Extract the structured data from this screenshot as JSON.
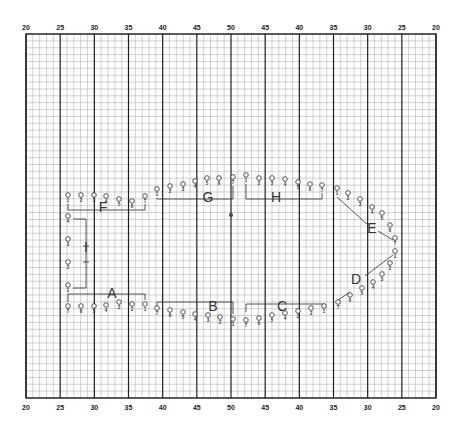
{
  "diagram": {
    "type": "seating-plan-on-graph-paper",
    "colors": {
      "ink": "#2a2a2a",
      "grid_minor": "#9a9a9a",
      "grid_major": "#1e1e1e",
      "paper": "#ffffff"
    },
    "grid": {
      "left": 26,
      "right": 436,
      "top": 34,
      "bottom": 398,
      "minor_step": 6.83,
      "major_every": 5
    },
    "axis_top_labels": [
      "20",
      "25",
      "30",
      "35",
      "40",
      "45",
      "50",
      "45",
      "40",
      "35",
      "30",
      "25",
      "20"
    ],
    "axis_bottom_labels": [
      "20",
      "25",
      "30",
      "35",
      "40",
      "45",
      "50",
      "45",
      "40",
      "35",
      "30",
      "25",
      "20"
    ],
    "center_mark": {
      "x": 231,
      "y": 215
    },
    "groups": [
      {
        "label": "A",
        "x": 112,
        "y": 298
      },
      {
        "label": "B",
        "x": 213,
        "y": 311
      },
      {
        "label": "C",
        "x": 282,
        "y": 311
      },
      {
        "label": "D",
        "x": 356,
        "y": 284
      },
      {
        "label": "E",
        "x": 372,
        "y": 233
      },
      {
        "label": "F",
        "x": 103,
        "y": 212
      },
      {
        "label": "G",
        "x": 208,
        "y": 202
      },
      {
        "label": "H",
        "x": 276,
        "y": 202
      },
      {
        "label": "I",
        "x": 86,
        "y": 252
      }
    ],
    "seats": [
      {
        "n": "1",
        "x": 68,
        "y": 198
      },
      {
        "n": "2",
        "x": 81,
        "y": 198
      },
      {
        "n": "3",
        "x": 94,
        "y": 198
      },
      {
        "n": "4",
        "x": 106,
        "y": 199
      },
      {
        "n": "5",
        "x": 119,
        "y": 202
      },
      {
        "n": "6",
        "x": 132,
        "y": 204
      },
      {
        "n": "7",
        "x": 145,
        "y": 199
      },
      {
        "n": "1",
        "x": 157,
        "y": 192
      },
      {
        "n": "2",
        "x": 170,
        "y": 189
      },
      {
        "n": "3",
        "x": 183,
        "y": 187
      },
      {
        "n": "4",
        "x": 195,
        "y": 184
      },
      {
        "n": "5",
        "x": 207,
        "y": 181
      },
      {
        "n": "6",
        "x": 219,
        "y": 181
      },
      {
        "n": "7",
        "x": 233,
        "y": 180
      },
      {
        "n": "1",
        "x": 246,
        "y": 178
      },
      {
        "n": "2",
        "x": 259,
        "y": 181
      },
      {
        "n": "3",
        "x": 272,
        "y": 181
      },
      {
        "n": "4",
        "x": 285,
        "y": 182
      },
      {
        "n": "5",
        "x": 298,
        "y": 185
      },
      {
        "n": "6",
        "x": 310,
        "y": 187
      },
      {
        "n": "7",
        "x": 322,
        "y": 188
      },
      {
        "n": "1",
        "x": 337,
        "y": 191
      },
      {
        "n": "2",
        "x": 348,
        "y": 196
      },
      {
        "n": "3",
        "x": 360,
        "y": 202
      },
      {
        "n": "4",
        "x": 372,
        "y": 210
      },
      {
        "n": "5",
        "x": 382,
        "y": 216
      },
      {
        "n": "6",
        "x": 390,
        "y": 228
      },
      {
        "n": "7",
        "x": 395,
        "y": 241
      },
      {
        "n": "1",
        "x": 395,
        "y": 254
      },
      {
        "n": "2",
        "x": 390,
        "y": 266
      },
      {
        "n": "3",
        "x": 382,
        "y": 277
      },
      {
        "n": "4",
        "x": 373,
        "y": 285
      },
      {
        "n": "5",
        "x": 362,
        "y": 291
      },
      {
        "n": "6",
        "x": 350,
        "y": 298
      },
      {
        "n": "7",
        "x": 338,
        "y": 305
      },
      {
        "n": "1",
        "x": 324,
        "y": 309
      },
      {
        "n": "2",
        "x": 311,
        "y": 311
      },
      {
        "n": "3",
        "x": 298,
        "y": 314
      },
      {
        "n": "4",
        "x": 285,
        "y": 316
      },
      {
        "n": "5",
        "x": 272,
        "y": 318
      },
      {
        "n": "6",
        "x": 259,
        "y": 321
      },
      {
        "n": "7",
        "x": 246,
        "y": 323
      },
      {
        "n": "1",
        "x": 233,
        "y": 322
      },
      {
        "n": "2",
        "x": 220,
        "y": 320
      },
      {
        "n": "3",
        "x": 208,
        "y": 318
      },
      {
        "n": "4",
        "x": 195,
        "y": 317
      },
      {
        "n": "5",
        "x": 183,
        "y": 315
      },
      {
        "n": "6",
        "x": 170,
        "y": 313
      },
      {
        "n": "7",
        "x": 157,
        "y": 311
      },
      {
        "n": "1",
        "x": 145,
        "y": 307
      },
      {
        "n": "2",
        "x": 132,
        "y": 307
      },
      {
        "n": "3",
        "x": 119,
        "y": 305
      },
      {
        "n": "4",
        "x": 106,
        "y": 308
      },
      {
        "n": "5",
        "x": 94,
        "y": 309
      },
      {
        "n": "6",
        "x": 81,
        "y": 309
      },
      {
        "n": "7",
        "x": 68,
        "y": 309
      },
      {
        "n": "1",
        "x": 68,
        "y": 288
      },
      {
        "n": "2",
        "x": 68,
        "y": 265
      },
      {
        "n": "3",
        "x": 68,
        "y": 242
      },
      {
        "n": "4",
        "x": 68,
        "y": 219
      }
    ]
  }
}
